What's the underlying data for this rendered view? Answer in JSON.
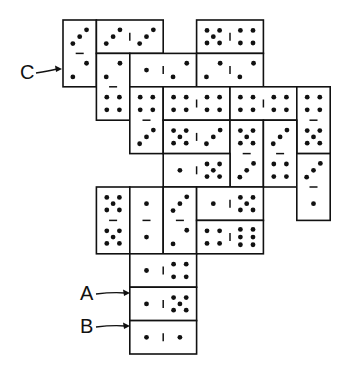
{
  "diagram": {
    "cell": 33.4,
    "origin": [
      63,
      20
    ],
    "ink": "#111111",
    "labels": [
      {
        "text": "C",
        "x": 20,
        "y": 62,
        "arrow_to": [
          62,
          69
        ]
      },
      {
        "text": "A",
        "x": 80,
        "y": 283,
        "arrow_to": [
          130,
          293
        ]
      },
      {
        "text": "B",
        "x": 80,
        "y": 316,
        "arrow_to": [
          130,
          326
        ]
      }
    ],
    "dominoes": [
      {
        "id": "d1",
        "col": 0,
        "row": 0,
        "dir": "v",
        "a": 3,
        "b": 2
      },
      {
        "id": "d2",
        "col": 1,
        "row": 0,
        "dir": "h",
        "a": 3,
        "b": 3
      },
      {
        "id": "d3",
        "col": 4,
        "row": 0,
        "dir": "h",
        "a": 5,
        "b": 4
      },
      {
        "id": "d4",
        "col": 1,
        "row": 1,
        "dir": "v",
        "a": 2,
        "b": 4
      },
      {
        "id": "d5",
        "col": 2,
        "row": 1,
        "dir": "h",
        "a": 1,
        "b": 2
      },
      {
        "id": "d6",
        "col": 4,
        "row": 1,
        "dir": "h",
        "a": 2,
        "b": 2
      },
      {
        "id": "d7",
        "col": 2,
        "row": 2,
        "dir": "v",
        "a": 4,
        "b": 3
      },
      {
        "id": "d8",
        "col": 3,
        "row": 2,
        "dir": "h",
        "a": 4,
        "b": 4
      },
      {
        "id": "d9",
        "col": 5,
        "row": 2,
        "dir": "h",
        "a": 4,
        "b": 4
      },
      {
        "id": "d10",
        "col": 7,
        "row": 2,
        "dir": "v",
        "a": 4,
        "b": 5
      },
      {
        "id": "d11",
        "col": 3,
        "row": 3,
        "dir": "h",
        "a": 5,
        "b": 3
      },
      {
        "id": "d12",
        "col": 5,
        "row": 3,
        "dir": "v",
        "a": 5,
        "b": 3
      },
      {
        "id": "d13",
        "col": 6,
        "row": 3,
        "dir": "v",
        "a": 3,
        "b": 4
      },
      {
        "id": "d14",
        "col": 7,
        "row": 4,
        "dir": "v",
        "a": 3,
        "b": 1
      },
      {
        "id": "d15",
        "col": 3,
        "row": 4,
        "dir": "h",
        "a": 1,
        "b": 5
      },
      {
        "id": "d16",
        "col": 1,
        "row": 5,
        "dir": "v",
        "a": 5,
        "b": 5
      },
      {
        "id": "d17",
        "col": 2,
        "row": 5,
        "dir": "v",
        "a": 1,
        "b": 1
      },
      {
        "id": "d18",
        "col": 3,
        "row": 5,
        "dir": "v",
        "a": 3,
        "b": 2
      },
      {
        "id": "d19",
        "col": 4,
        "row": 5,
        "dir": "h",
        "a": 1,
        "b": 5
      },
      {
        "id": "d20",
        "col": 4,
        "row": 6,
        "dir": "h",
        "a": 4,
        "b": 6
      },
      {
        "id": "d21",
        "col": 2,
        "row": 7,
        "dir": "h",
        "a": 1,
        "b": 4
      },
      {
        "id": "d22",
        "col": 2,
        "row": 8,
        "dir": "h",
        "a": 1,
        "b": 5,
        "label": "A"
      },
      {
        "id": "d23",
        "col": 2,
        "row": 9,
        "dir": "h",
        "a": 1,
        "b": 1,
        "label": "B"
      }
    ]
  }
}
